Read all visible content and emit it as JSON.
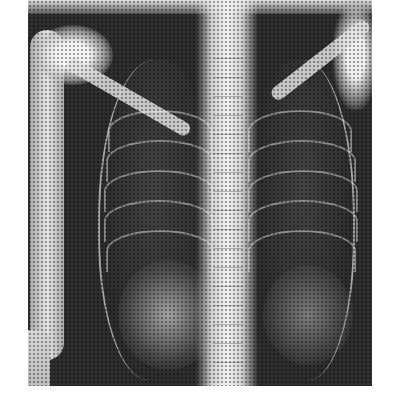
{
  "image": {
    "subject": "chest-xray",
    "view": "frontal",
    "background_color": "#ffffff",
    "film_bounds": {
      "left": 28,
      "top": 0,
      "right": 372,
      "bottom": 386
    },
    "colors": {
      "dark_lung": "#2e2e2e",
      "bone": "#f2f2f2"
    }
  }
}
